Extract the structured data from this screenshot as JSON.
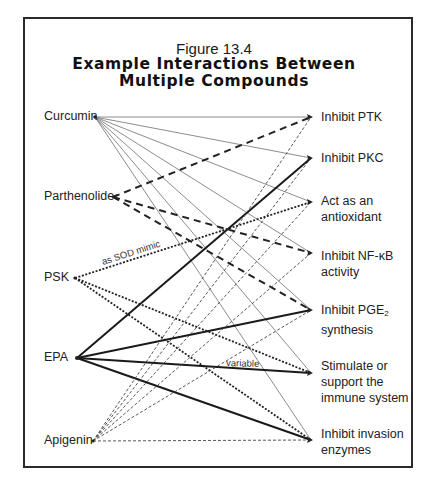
{
  "figure": {
    "number": "Figure 13.4",
    "title_line1": "Example Interactions Between",
    "title_line2": "Multiple Compounds"
  },
  "compounds": [
    {
      "id": "curcumin",
      "label": "Curcumin"
    },
    {
      "id": "parthenolide",
      "label": "Parthenolide"
    },
    {
      "id": "psk",
      "label": "PSK"
    },
    {
      "id": "epa",
      "label": "EPA"
    },
    {
      "id": "apigenin",
      "label": "Apigenin"
    }
  ],
  "effects": [
    {
      "id": "ptk",
      "line1": "Inhibit PTK",
      "line2": ""
    },
    {
      "id": "pkc",
      "line1": "Inhibit PKC",
      "line2": ""
    },
    {
      "id": "antioxidant",
      "line1": "Act as an",
      "line2": "antioxidant"
    },
    {
      "id": "nfkb",
      "line1": "Inhibit NF-κB",
      "line2": "activity"
    },
    {
      "id": "pge2",
      "line1": "Inhibit PGE",
      "line1_sub": "2",
      "line2": "synthesis"
    },
    {
      "id": "immune",
      "line1": "Stimulate or",
      "line2": "support the",
      "line3": "immune system"
    },
    {
      "id": "invasion",
      "line1": "Inhibit invasion",
      "line2": "enzymes"
    }
  ],
  "line_styles": {
    "curcumin": {
      "style": "thin solid",
      "color": "#7a7a7a"
    },
    "parthenolide": {
      "style": "bold dashed",
      "color": "#222222"
    },
    "psk": {
      "style": "dotted",
      "color": "#222222"
    },
    "epa": {
      "style": "bold solid",
      "color": "#1a1a1a"
    },
    "apigenin": {
      "style": "thin dashed",
      "color": "#555555"
    }
  },
  "connections": [
    {
      "from": "curcumin",
      "to": "ptk"
    },
    {
      "from": "curcumin",
      "to": "pkc"
    },
    {
      "from": "curcumin",
      "to": "antioxidant"
    },
    {
      "from": "curcumin",
      "to": "nfkb"
    },
    {
      "from": "curcumin",
      "to": "pge2"
    },
    {
      "from": "curcumin",
      "to": "immune"
    },
    {
      "from": "curcumin",
      "to": "invasion"
    },
    {
      "from": "parthenolide",
      "to": "ptk"
    },
    {
      "from": "parthenolide",
      "to": "nfkb"
    },
    {
      "from": "parthenolide",
      "to": "pge2"
    },
    {
      "from": "psk",
      "to": "antioxidant",
      "annotation": "as SOD mimic"
    },
    {
      "from": "psk",
      "to": "immune"
    },
    {
      "from": "psk",
      "to": "invasion"
    },
    {
      "from": "epa",
      "to": "pkc"
    },
    {
      "from": "epa",
      "to": "pge2"
    },
    {
      "from": "epa",
      "to": "immune",
      "annotation": "variable"
    },
    {
      "from": "epa",
      "to": "invasion"
    },
    {
      "from": "apigenin",
      "to": "ptk"
    },
    {
      "from": "apigenin",
      "to": "pkc"
    },
    {
      "from": "apigenin",
      "to": "antioxidant"
    },
    {
      "from": "apigenin",
      "to": "nfkb"
    },
    {
      "from": "apigenin",
      "to": "pge2"
    },
    {
      "from": "apigenin",
      "to": "invasion"
    }
  ],
  "annotations": {
    "sod": "as SOD mimic",
    "variable": "variable"
  }
}
